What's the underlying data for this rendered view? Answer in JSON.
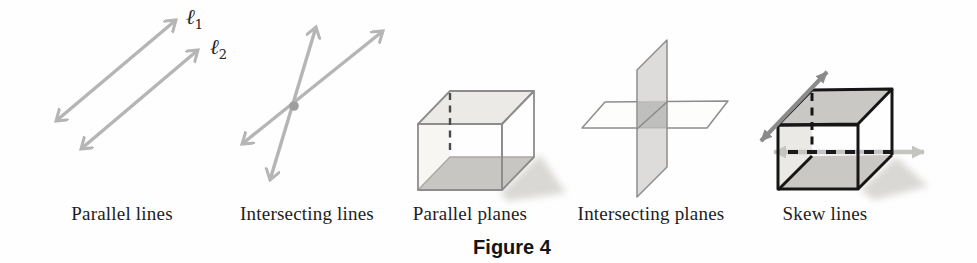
{
  "figure": {
    "caption": "Figure 4"
  },
  "panels": [
    {
      "id": "parallel-lines",
      "caption": "Parallel lines",
      "line_labels": [
        {
          "symbol": "ℓ",
          "sub": "1"
        },
        {
          "symbol": "ℓ",
          "sub": "2"
        }
      ]
    },
    {
      "id": "intersecting-lines",
      "caption": "Intersecting lines"
    },
    {
      "id": "parallel-planes",
      "caption": "Parallel planes"
    },
    {
      "id": "intersecting-planes",
      "caption": "Intersecting planes"
    },
    {
      "id": "skew-lines",
      "caption": "Skew lines"
    }
  ],
  "colors": {
    "light_arrow_gray": "#b5b5b5",
    "intersection_dot": "#9e9e9e",
    "thin_cube_edge": "#8d8d8d",
    "shaded_face": "#c7c6c3",
    "light_face": "#eceae6",
    "plane_fill": "#d3d2d0",
    "plane_overlap": "#9c9b99",
    "bold_cube_edge": "#161616",
    "dark_arrow_gray": "#8b8b8b",
    "pale_arrow_gray": "#c5c4c1",
    "shadow": "#d9d8d4",
    "caption_text": "#1d1d1d"
  }
}
